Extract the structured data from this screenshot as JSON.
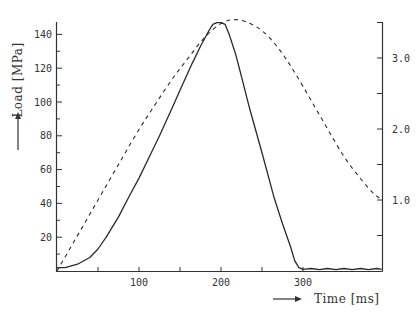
{
  "chart_data": {
    "type": "line",
    "title": "",
    "xlabel": "Time [ms]",
    "ylabel": "Load [MPa]",
    "y2label": "",
    "xlim": [
      0,
      396
    ],
    "ylim": [
      0,
      150
    ],
    "y2lim": [
      0,
      3.55
    ],
    "x_ticks": [
      100,
      200,
      300
    ],
    "x_minor_ticks": [
      50,
      150,
      250
    ],
    "y_ticks": [
      20,
      40,
      60,
      80,
      100,
      120,
      140
    ],
    "y_minor_step": 10,
    "y2_ticks": [
      1.0,
      2.0,
      3.0
    ],
    "y2_tick_labels": [
      "1.0",
      "2.0",
      "3.0"
    ],
    "y2_minor_ticks": [
      0.5,
      1.5,
      2.5,
      3.5
    ],
    "grid": false,
    "legend": null,
    "series": [
      {
        "name": "Load (measured)",
        "style": "solid",
        "axis": "left",
        "x": [
          0,
          10,
          25,
          40,
          50,
          60,
          75,
          90,
          100,
          115,
          125,
          140,
          150,
          165,
          175,
          185,
          190,
          195,
          200,
          205,
          210,
          218,
          225,
          235,
          250,
          265,
          275,
          285,
          290,
          295,
          300,
          310,
          320,
          330,
          340,
          350,
          360,
          370,
          380,
          390,
          396
        ],
        "values": [
          2,
          2,
          4,
          8,
          13,
          20,
          32,
          46,
          55,
          70,
          80,
          96,
          107,
          123,
          133,
          142,
          146,
          147,
          147,
          146,
          140,
          128,
          115,
          96,
          70,
          43,
          28,
          14,
          6,
          2,
          1,
          1.5,
          0.8,
          1.5,
          0.8,
          1.5,
          0.8,
          1.5,
          0.8,
          1.5,
          1
        ]
      },
      {
        "name": "Reference (half-sine)",
        "style": "dashed",
        "axis": "right",
        "x": [
          0,
          20,
          40,
          60,
          80,
          100,
          120,
          140,
          160,
          180,
          200,
          215,
          230,
          250,
          270,
          290,
          310,
          330,
          350,
          370,
          385,
          396
        ],
        "values": [
          0.0,
          0.4,
          0.8,
          1.2,
          1.6,
          2.0,
          2.35,
          2.7,
          3.0,
          3.3,
          3.5,
          3.55,
          3.52,
          3.4,
          3.15,
          2.8,
          2.4,
          2.0,
          1.6,
          1.3,
          1.1,
          1.0
        ]
      }
    ]
  }
}
